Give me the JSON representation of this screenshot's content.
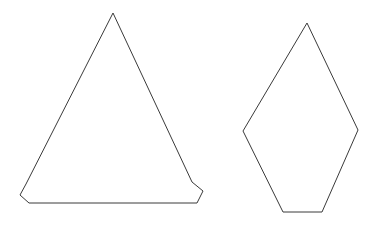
{
  "canvas": {
    "width": 380,
    "height": 225,
    "background_color": "#ffffff",
    "stroke_color": "#3a3a3a",
    "fill_color": "#ffffff",
    "stroke_width": 1
  },
  "shapes": [
    {
      "id": "left-shape",
      "name": "chamfered-triangle",
      "description": "Tall isoceles triangle whose two bottom corners are cut off by short chamfer edges, giving a five-sided outline.",
      "sides": 5,
      "points": "113,13 192,182 203,191 197,203 29,203 20,195 26,184",
      "vertices": [
        [
          113,
          13
        ],
        [
          192,
          182
        ],
        [
          203,
          191
        ],
        [
          197,
          203
        ],
        [
          29,
          203
        ],
        [
          20,
          195
        ],
        [
          26,
          184
        ]
      ],
      "apex": [
        113,
        13
      ],
      "bounding_box": {
        "x": 20,
        "y": 13,
        "width": 183,
        "height": 190
      }
    },
    {
      "id": "right-shape",
      "name": "kite-pentagon",
      "description": "Kite-like pentagon with a sharp top apex, two wide side vertices near mid-height, and a short flat bottom edge.",
      "sides": 5,
      "points": "307,23 358,130 322,212 283,212 243,131",
      "vertices": [
        [
          307,
          23
        ],
        [
          358,
          130
        ],
        [
          322,
          212
        ],
        [
          283,
          212
        ],
        [
          243,
          131
        ]
      ],
      "apex": [
        307,
        23
      ],
      "bounding_box": {
        "x": 243,
        "y": 23,
        "width": 115,
        "height": 189
      }
    }
  ]
}
